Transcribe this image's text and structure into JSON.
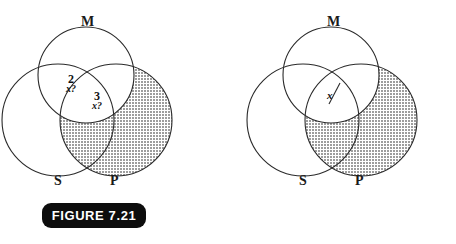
{
  "page": {
    "background_color": "#ffffff",
    "stroke_color": "#2a2a2a",
    "shade_color": "#a9a9a9"
  },
  "figures": [
    {
      "id": "figure-7-21",
      "caption": "FIGURE 7.21",
      "circles": [
        {
          "name": "M",
          "label": "M"
        },
        {
          "name": "S",
          "label": "S"
        },
        {
          "name": "P",
          "label": "P"
        }
      ],
      "shaded_region": "P-minus-M",
      "annotations": [
        {
          "name": "sm-region-note",
          "number": "2",
          "quantifier": "x?"
        },
        {
          "name": "smp-region-note",
          "number": "3",
          "quantifier": "x?"
        }
      ]
    },
    {
      "id": "figure-7-22",
      "caption": "FIGURE 7.22",
      "circles": [
        {
          "name": "M",
          "label": "M"
        },
        {
          "name": "S",
          "label": "S"
        },
        {
          "name": "P",
          "label": "P"
        }
      ],
      "shaded_region": "P-minus-M",
      "annotations": [
        {
          "name": "x-mark",
          "text": "x"
        }
      ]
    }
  ]
}
